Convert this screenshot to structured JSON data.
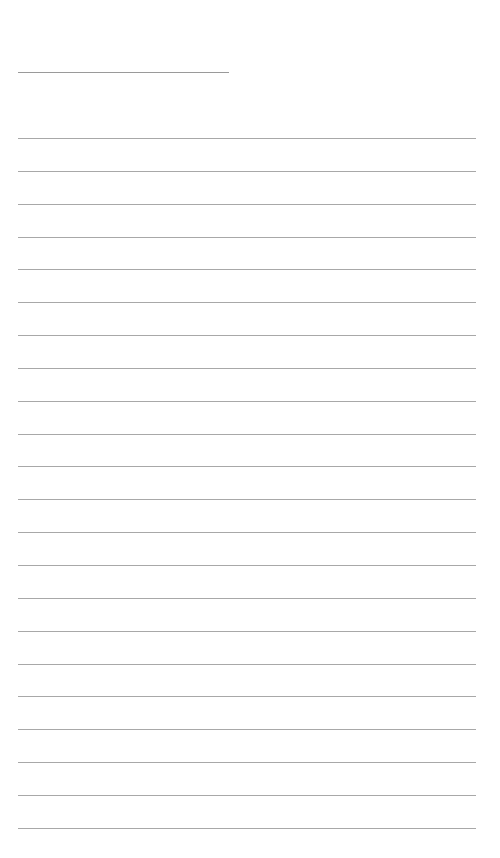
{
  "page": {
    "type": "blank-ruled-sheet",
    "title_line_count": 1,
    "ruled_line_count": 22,
    "line_color": "#a8a8a8",
    "background": "#ffffff"
  }
}
